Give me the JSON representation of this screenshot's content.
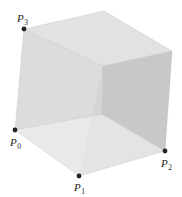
{
  "figure": {
    "width": 182,
    "height": 197,
    "background": "#ffffff"
  },
  "vertices": {
    "P0": {
      "x": 15,
      "y": 130
    },
    "P1": {
      "x": 79,
      "y": 176
    },
    "P2": {
      "x": 165,
      "y": 151
    },
    "P3": {
      "x": 24,
      "y": 29
    },
    "top_back": {
      "x": 104,
      "y": 11
    },
    "top_right": {
      "x": 172,
      "y": 51
    },
    "inner_top": {
      "x": 103,
      "y": 66
    },
    "inner_bottom": {
      "x": 102,
      "y": 114
    }
  },
  "faces": [
    {
      "name": "back-bottom-face",
      "points": "15,130 102,114 165,151 79,176",
      "fill": "#ececec"
    },
    {
      "name": "back-left-face",
      "points": "24,29 103,66 102,114 15,130",
      "fill": "#d7d7d7"
    },
    {
      "name": "back-right-face",
      "points": "103,66 172,51 165,151 102,114",
      "fill": "#c4c4c4"
    },
    {
      "name": "top-face",
      "points": "24,29 104,11 172,51 103,66",
      "fill": "#e2e2e2"
    },
    {
      "name": "front-left-face",
      "points": "24,29 15,130 79,176 103,66",
      "fill": "#e4e4e4",
      "opacity": 0.35
    },
    {
      "name": "front-right-face",
      "points": "79,176 165,151 172,51 103,66",
      "fill": "#d0d0d0",
      "opacity": 0.3
    }
  ],
  "edge_color": "#b5b5b5",
  "point_color": "#222222",
  "labels": [
    {
      "id": "P0",
      "main": "P",
      "sub": "0",
      "x": 10,
      "y": 146,
      "dot_x": 15,
      "dot_y": 130
    },
    {
      "id": "P1",
      "main": "P",
      "sub": "1",
      "x": 74,
      "y": 191,
      "dot_x": 79,
      "dot_y": 176
    },
    {
      "id": "P2",
      "main": "P",
      "sub": "2",
      "x": 161,
      "y": 167,
      "dot_x": 165,
      "dot_y": 151
    },
    {
      "id": "P3",
      "main": "P",
      "sub": "3",
      "x": 17,
      "y": 22,
      "dot_x": 24,
      "dot_y": 29
    }
  ]
}
